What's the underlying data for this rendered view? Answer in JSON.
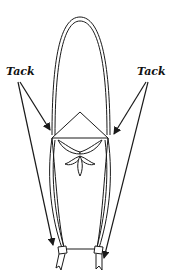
{
  "diagram": {
    "type": "knot-tying illustration",
    "labels": {
      "left": "Tack",
      "right": "Tack"
    },
    "colors": {
      "stroke": "#1a1a1a",
      "background": "#ffffff"
    },
    "elements": [
      "outer-loop",
      "diamond-fold",
      "trefoil-ornament",
      "left-strands",
      "right-strands",
      "bottom-connector",
      "left-knot",
      "right-knot",
      "left-tail",
      "right-tail",
      "tack-arrows"
    ]
  }
}
